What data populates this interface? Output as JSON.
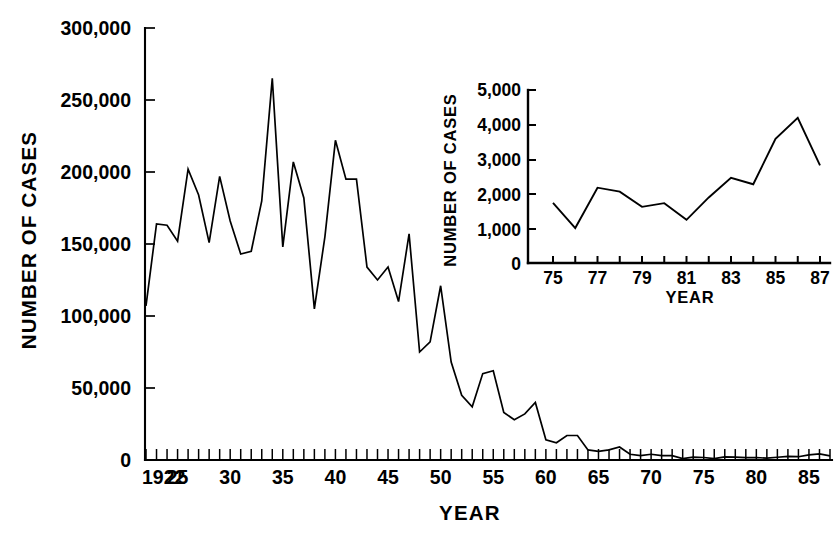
{
  "chart_data": [
    {
      "id": "main",
      "type": "line",
      "title": "",
      "xlabel": "YEAR",
      "ylabel": "NUMBER OF CASES",
      "xlim": [
        1922,
        1987
      ],
      "ylim": [
        0,
        300000
      ],
      "grid": false,
      "legend": null,
      "y_ticks": [
        0,
        50000,
        100000,
        150000,
        200000,
        250000,
        300000
      ],
      "y_tick_labels": [
        "0",
        "50,000",
        "100,000",
        "150,000",
        "200,000",
        "250,000",
        "300,000"
      ],
      "x_ticks": [
        1922,
        1925,
        1930,
        1935,
        1940,
        1945,
        1950,
        1955,
        1960,
        1965,
        1970,
        1975,
        1980,
        1985
      ],
      "x_tick_labels": [
        "1922",
        "25",
        "30",
        "35",
        "40",
        "45",
        "50",
        "55",
        "60",
        "65",
        "70",
        "75",
        "80",
        "85"
      ],
      "x_minor_tick_step": 1,
      "x": [
        1922,
        1923,
        1924,
        1925,
        1926,
        1927,
        1928,
        1929,
        1930,
        1931,
        1932,
        1933,
        1934,
        1935,
        1936,
        1937,
        1938,
        1939,
        1940,
        1941,
        1942,
        1943,
        1944,
        1945,
        1946,
        1947,
        1948,
        1949,
        1950,
        1951,
        1952,
        1953,
        1954,
        1955,
        1956,
        1957,
        1958,
        1959,
        1960,
        1961,
        1962,
        1963,
        1964,
        1965,
        1966,
        1967,
        1968,
        1969,
        1970,
        1971,
        1972,
        1973,
        1974,
        1975,
        1976,
        1977,
        1978,
        1979,
        1980,
        1981,
        1982,
        1983,
        1984,
        1985,
        1986,
        1987
      ],
      "values": [
        107000,
        164000,
        163000,
        152000,
        202000,
        184000,
        151000,
        197000,
        166000,
        143000,
        145000,
        180000,
        265000,
        148000,
        207000,
        182000,
        105000,
        155000,
        222000,
        195000,
        195000,
        134000,
        125000,
        134000,
        110000,
        157000,
        75000,
        82000,
        121000,
        68000,
        45000,
        37000,
        60000,
        62000,
        33000,
        28000,
        32000,
        40000,
        14000,
        12000,
        17000,
        17000,
        7000,
        6000,
        7000,
        9000,
        4000,
        3000,
        4000,
        3000,
        3000,
        1000,
        2000,
        1738,
        1010,
        2177,
        2063,
        1623,
        1730,
        1248,
        1895,
        2463,
        2276,
        3589,
        4195,
        2823
      ]
    },
    {
      "id": "inset",
      "type": "line",
      "title": "",
      "xlabel": "YEAR",
      "ylabel": "NUMBER OF CASES",
      "xlim": [
        1975,
        1987
      ],
      "ylim": [
        0,
        5000
      ],
      "grid": false,
      "legend": null,
      "y_ticks": [
        0,
        1000,
        2000,
        3000,
        4000,
        5000
      ],
      "y_tick_labels": [
        "0",
        "1,000",
        "2,000",
        "3,000",
        "4,000",
        "5,000"
      ],
      "x_ticks": [
        1975,
        1977,
        1979,
        1981,
        1983,
        1985,
        1987
      ],
      "x_tick_labels": [
        "75",
        "77",
        "79",
        "81",
        "83",
        "85",
        "87"
      ],
      "x_minor_tick_step": 1,
      "x": [
        1975,
        1976,
        1977,
        1978,
        1979,
        1980,
        1981,
        1982,
        1983,
        1984,
        1985,
        1986,
        1987
      ],
      "values": [
        1738,
        1010,
        2177,
        2063,
        1623,
        1730,
        1248,
        1895,
        2463,
        2276,
        3589,
        4195,
        2823
      ]
    }
  ]
}
